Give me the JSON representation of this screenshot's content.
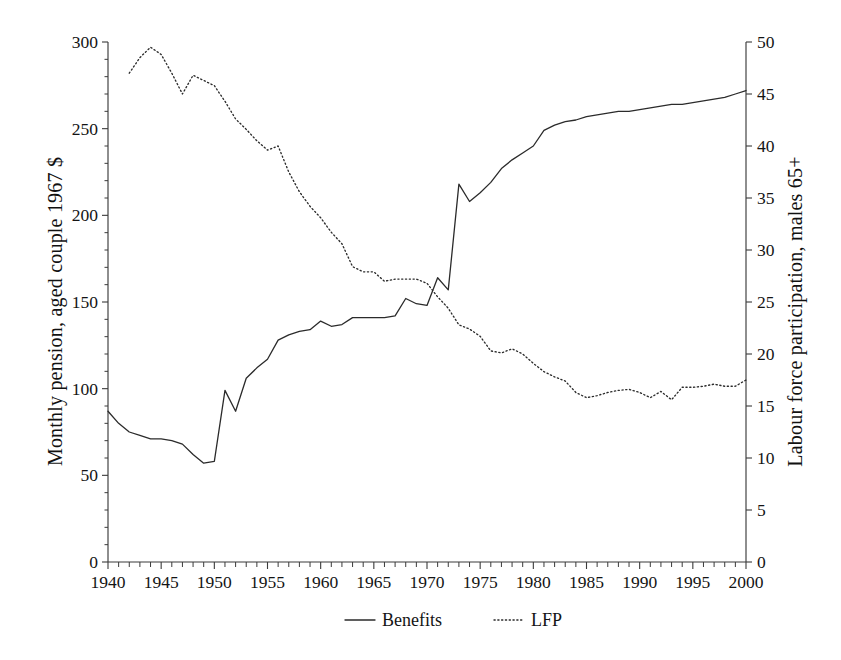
{
  "chart_data": {
    "type": "line",
    "title": "",
    "subtitle": "",
    "xlabel": "",
    "ylabel": "Monthly pension, aged couple 1967 $",
    "ylabel_right": "Labour force participation, males 65+",
    "xlim": [
      1940,
      2000
    ],
    "ylim": [
      0,
      300
    ],
    "ylim_right": [
      0,
      50
    ],
    "grid": false,
    "legend_position": "bottom-center",
    "xticks": [
      1940,
      1945,
      1950,
      1955,
      1960,
      1965,
      1970,
      1975,
      1980,
      1985,
      1990,
      1995,
      2000
    ],
    "xticks_labels": [
      "1940",
      "1945",
      "1950",
      "1955",
      "1960",
      "1965",
      "1970",
      "1975",
      "1980",
      "1985",
      "1990",
      "1995",
      "2000"
    ],
    "xtick_minor_step": 1,
    "yticks_left": [
      0,
      50,
      100,
      150,
      200,
      250,
      300
    ],
    "yticks_left_labels": [
      "0",
      "50",
      "100",
      "150",
      "200",
      "250",
      "300"
    ],
    "yticks_right": [
      0,
      5,
      10,
      15,
      20,
      25,
      30,
      35,
      40,
      45,
      50
    ],
    "yticks_right_labels": [
      "0",
      "5",
      "10",
      "15",
      "20",
      "25",
      "30",
      "35",
      "40",
      "45",
      "50"
    ],
    "series": [
      {
        "name": "Benefits",
        "axis": "left",
        "style": "solid",
        "color": "#2b2b2b",
        "x": [
          1940,
          1941,
          1942,
          1943,
          1944,
          1945,
          1946,
          1947,
          1948,
          1949,
          1950,
          1951,
          1952,
          1953,
          1954,
          1955,
          1956,
          1957,
          1958,
          1959,
          1960,
          1961,
          1962,
          1963,
          1964,
          1965,
          1966,
          1967,
          1968,
          1969,
          1970,
          1971,
          1972,
          1973,
          1974,
          1975,
          1976,
          1977,
          1978,
          1979,
          1980,
          1981,
          1982,
          1983,
          1984,
          1985,
          1986,
          1987,
          1988,
          1989,
          1990,
          1991,
          1992,
          1993,
          1994,
          1995,
          1996,
          1997,
          1998,
          1999,
          2000
        ],
        "y": [
          87,
          80,
          75,
          73,
          71,
          71,
          70,
          68,
          62,
          57,
          58,
          99,
          87,
          106,
          112,
          117,
          128,
          131,
          133,
          134,
          139,
          136,
          137,
          141,
          141,
          141,
          141,
          142,
          152,
          149,
          148,
          164,
          157,
          218,
          208,
          213,
          219,
          227,
          232,
          236,
          240,
          249,
          252,
          254,
          255,
          257,
          258,
          259,
          260,
          260,
          261,
          262,
          263,
          264,
          264,
          265,
          266,
          267,
          268,
          270,
          272
        ]
      },
      {
        "name": "LFP",
        "axis": "right",
        "style": "dotted",
        "color": "#2b2b2b",
        "x": [
          1942,
          1943,
          1944,
          1945,
          1946,
          1947,
          1948,
          1949,
          1950,
          1951,
          1952,
          1953,
          1954,
          1955,
          1956,
          1957,
          1958,
          1959,
          1960,
          1961,
          1962,
          1963,
          1964,
          1965,
          1966,
          1967,
          1968,
          1969,
          1970,
          1971,
          1972,
          1973,
          1974,
          1975,
          1976,
          1977,
          1978,
          1979,
          1980,
          1981,
          1982,
          1983,
          1984,
          1985,
          1986,
          1987,
          1988,
          1989,
          1990,
          1991,
          1992,
          1993,
          1994,
          1995,
          1996,
          1997,
          1998,
          1999,
          2000
        ],
        "y": [
          47.0,
          48.5,
          49.5,
          48.8,
          47.0,
          45.0,
          46.8,
          46.3,
          45.8,
          44.3,
          42.6,
          41.6,
          40.5,
          39.6,
          40.0,
          37.5,
          35.6,
          34.2,
          33.1,
          31.7,
          30.6,
          28.4,
          27.9,
          27.9,
          27.0,
          27.2,
          27.2,
          27.2,
          26.8,
          25.5,
          24.4,
          22.8,
          22.4,
          21.7,
          20.3,
          20.1,
          20.5,
          20.0,
          19.1,
          18.3,
          17.8,
          17.4,
          16.3,
          15.8,
          16.0,
          16.3,
          16.5,
          16.6,
          16.3,
          15.8,
          16.4,
          15.6,
          16.8,
          16.8,
          16.9,
          17.1,
          16.9,
          16.9,
          17.5
        ]
      }
    ],
    "annotations": []
  },
  "legend": {
    "items": [
      {
        "label": "Benefits",
        "style": "solid"
      },
      {
        "label": "LFP",
        "style": "dotted"
      }
    ]
  },
  "axes": {
    "left_title": "Monthly pension, aged couple 1967 $",
    "right_title": "Labour force participation, males 65+"
  }
}
